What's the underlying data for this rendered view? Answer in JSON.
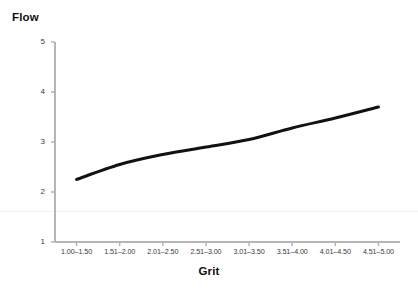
{
  "chart_data": {
    "type": "line",
    "title": "",
    "xlabel": "Grit",
    "ylabel": "Flow",
    "categories": [
      "1.00–1.50",
      "1.51–2.00",
      "2.01–2.50",
      "2.51–3.00",
      "3.01–3.50",
      "3.51–4.00",
      "4.01–4.50",
      "4.51–5.00"
    ],
    "values": [
      2.25,
      2.55,
      2.75,
      2.9,
      3.05,
      3.28,
      3.48,
      3.7
    ],
    "series": [
      {
        "name": "Flow",
        "values": [
          2.25,
          2.55,
          2.75,
          2.9,
          3.05,
          3.28,
          3.48,
          3.7
        ],
        "color": "#111111"
      }
    ],
    "ylim": [
      1,
      5
    ],
    "yticks": [
      1,
      2,
      3,
      4,
      5
    ],
    "ytick_labels": [
      "1",
      "2",
      "3",
      "4",
      "5"
    ],
    "grid": false,
    "legend": false,
    "legend_position": "none",
    "line_width": 3,
    "markers": false,
    "axis_color": "#b5b5b5",
    "background": "#ffffff"
  }
}
